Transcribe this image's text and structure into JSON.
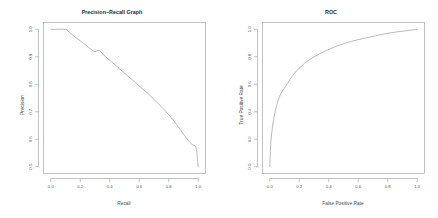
{
  "figure": {
    "background": "#ffffff",
    "curve_color": "#8d8d8d",
    "axis_color": "#9a9a9a",
    "panels": 2
  },
  "chart_data": [
    {
      "type": "line",
      "panel": "left",
      "title": "Precision−Recall Graph",
      "xlabel": "Recall",
      "ylabel": "Precision",
      "xlim": [
        0.0,
        1.0
      ],
      "ylim": [
        0.5,
        1.0
      ],
      "xticks": [
        0.0,
        0.2,
        0.4,
        0.6,
        0.8,
        1.0
      ],
      "xtick_labels": [
        "0.0",
        "0.2",
        "0.4",
        "0.6",
        "0.8",
        "1.0"
      ],
      "yticks": [
        0.5,
        0.6,
        0.7,
        0.8,
        0.9,
        1.0
      ],
      "ytick_labels": [
        "0.5",
        "0.6",
        "0.7",
        "0.8",
        "0.9",
        "1.0"
      ],
      "grid": false,
      "legend": false,
      "x": [
        0.0,
        0.02,
        0.04,
        0.06,
        0.08,
        0.1,
        0.112,
        0.12,
        0.13,
        0.14,
        0.15,
        0.16,
        0.17,
        0.18,
        0.19,
        0.2,
        0.215,
        0.23,
        0.245,
        0.26,
        0.275,
        0.29,
        0.3,
        0.31,
        0.32,
        0.33,
        0.34,
        0.35,
        0.36,
        0.375,
        0.39,
        0.405,
        0.42,
        0.435,
        0.45,
        0.465,
        0.48,
        0.495,
        0.51,
        0.525,
        0.54,
        0.555,
        0.57,
        0.585,
        0.6,
        0.615,
        0.63,
        0.645,
        0.66,
        0.675,
        0.69,
        0.705,
        0.72,
        0.735,
        0.75,
        0.765,
        0.78,
        0.795,
        0.81,
        0.825,
        0.84,
        0.855,
        0.87,
        0.885,
        0.9,
        0.912,
        0.925,
        0.935,
        0.945,
        0.955,
        0.962,
        0.97,
        0.975,
        0.98,
        0.985,
        0.988,
        0.991,
        0.994,
        0.997,
        1.0
      ],
      "y": [
        1.0,
        1.0,
        1.0,
        1.0,
        1.0,
        1.0,
        0.998,
        0.992,
        0.988,
        0.982,
        0.978,
        0.974,
        0.97,
        0.966,
        0.962,
        0.958,
        0.952,
        0.946,
        0.94,
        0.933,
        0.927,
        0.921,
        0.918,
        0.921,
        0.924,
        0.922,
        0.918,
        0.912,
        0.906,
        0.899,
        0.892,
        0.885,
        0.878,
        0.871,
        0.864,
        0.857,
        0.85,
        0.843,
        0.836,
        0.829,
        0.822,
        0.815,
        0.808,
        0.801,
        0.794,
        0.787,
        0.78,
        0.773,
        0.766,
        0.758,
        0.75,
        0.742,
        0.734,
        0.726,
        0.718,
        0.71,
        0.701,
        0.692,
        0.683,
        0.673,
        0.663,
        0.652,
        0.641,
        0.63,
        0.618,
        0.61,
        0.601,
        0.594,
        0.588,
        0.583,
        0.58,
        0.578,
        0.577,
        0.576,
        0.572,
        0.562,
        0.548,
        0.532,
        0.515,
        0.5
      ]
    },
    {
      "type": "line",
      "panel": "right",
      "title": "ROC",
      "xlabel": "False Positive Rate",
      "ylabel": "True Positive Rate",
      "xlim": [
        0.0,
        1.0
      ],
      "ylim": [
        0.0,
        1.0
      ],
      "xticks": [
        0.0,
        0.2,
        0.4,
        0.6,
        0.8,
        1.0
      ],
      "xtick_labels": [
        "0.0",
        "0.2",
        "0.4",
        "0.6",
        "0.8",
        "1.0"
      ],
      "yticks": [
        0.0,
        0.2,
        0.4,
        0.6,
        0.8,
        1.0
      ],
      "ytick_labels": [
        "0.0",
        "0.2",
        "0.4",
        "0.6",
        "0.8",
        "1.0"
      ],
      "grid": false,
      "legend": false,
      "x": [
        0.0,
        0.002,
        0.004,
        0.006,
        0.009,
        0.012,
        0.015,
        0.018,
        0.022,
        0.026,
        0.03,
        0.035,
        0.04,
        0.046,
        0.052,
        0.058,
        0.065,
        0.072,
        0.08,
        0.088,
        0.096,
        0.105,
        0.112,
        0.12,
        0.128,
        0.136,
        0.145,
        0.155,
        0.165,
        0.175,
        0.186,
        0.198,
        0.21,
        0.222,
        0.235,
        0.248,
        0.262,
        0.276,
        0.29,
        0.305,
        0.32,
        0.335,
        0.35,
        0.365,
        0.38,
        0.396,
        0.412,
        0.428,
        0.444,
        0.46,
        0.478,
        0.496,
        0.514,
        0.532,
        0.55,
        0.57,
        0.59,
        0.61,
        0.63,
        0.65,
        0.672,
        0.694,
        0.716,
        0.738,
        0.76,
        0.782,
        0.804,
        0.826,
        0.848,
        0.87,
        0.892,
        0.914,
        0.936,
        0.958,
        0.98,
        1.0
      ],
      "y": [
        0.0,
        0.06,
        0.11,
        0.152,
        0.196,
        0.232,
        0.262,
        0.29,
        0.318,
        0.344,
        0.368,
        0.394,
        0.418,
        0.444,
        0.466,
        0.486,
        0.506,
        0.524,
        0.542,
        0.556,
        0.568,
        0.58,
        0.592,
        0.606,
        0.62,
        0.634,
        0.648,
        0.662,
        0.676,
        0.689,
        0.702,
        0.715,
        0.727,
        0.739,
        0.751,
        0.762,
        0.773,
        0.783,
        0.793,
        0.802,
        0.811,
        0.82,
        0.828,
        0.836,
        0.844,
        0.852,
        0.859,
        0.866,
        0.873,
        0.88,
        0.887,
        0.893,
        0.899,
        0.905,
        0.911,
        0.917,
        0.922,
        0.927,
        0.932,
        0.937,
        0.942,
        0.947,
        0.952,
        0.957,
        0.962,
        0.967,
        0.971,
        0.975,
        0.979,
        0.982,
        0.985,
        0.988,
        0.991,
        0.994,
        0.997,
        1.0
      ]
    }
  ]
}
